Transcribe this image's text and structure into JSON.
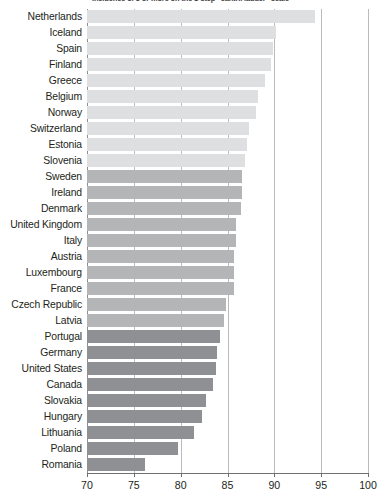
{
  "chart_data": {
    "type": "bar",
    "orientation": "horizontal",
    "title": "Incidence of 5 or more on the 1-step \"cantril ladder\" scale",
    "xlabel": "",
    "ylabel": "",
    "xlim": [
      70,
      100
    ],
    "xticks": [
      70,
      75,
      80,
      85,
      90,
      95,
      100
    ],
    "xtick_labels": [
      "70",
      "75",
      "80",
      "85",
      "90",
      "95",
      "100"
    ],
    "grid": true,
    "grid_axis": "x",
    "legend": false,
    "categories": [
      "Netherlands",
      "Iceland",
      "Spain",
      "Finland",
      "Greece",
      "Belgium",
      "Norway",
      "Switzerland",
      "Estonia",
      "Slovenia",
      "Sweden",
      "Ireland",
      "Denmark",
      "United Kingdom",
      "Italy",
      "Austria",
      "Luxembourg",
      "France",
      "Czech Republic",
      "Latvia",
      "Portugal",
      "Germany",
      "United States",
      "Canada",
      "Slovakia",
      "Hungary",
      "Lithuania",
      "Poland",
      "Romania"
    ],
    "values": [
      94.3,
      90.2,
      89.9,
      89.6,
      89.0,
      88.3,
      88.0,
      87.3,
      87.1,
      86.9,
      86.6,
      86.6,
      86.4,
      85.9,
      85.9,
      85.7,
      85.7,
      85.7,
      84.8,
      84.6,
      84.2,
      83.9,
      83.8,
      83.5,
      82.7,
      82.3,
      81.4,
      79.7,
      76.2
    ],
    "bar_colors": [
      "#dedfe0",
      "#dedfe0",
      "#dedfe0",
      "#dedfe0",
      "#dedfe0",
      "#dedfe0",
      "#dedfe0",
      "#dedfe0",
      "#dedfe0",
      "#dedfe0",
      "#b4b5b7",
      "#b4b5b7",
      "#b4b5b7",
      "#b4b5b7",
      "#b4b5b7",
      "#b4b5b7",
      "#b4b5b7",
      "#b4b5b7",
      "#b4b5b7",
      "#b4b5b7",
      "#8e9093",
      "#8e9093",
      "#8e9093",
      "#8e9093",
      "#8e9093",
      "#8e9093",
      "#8e9093",
      "#8e9093",
      "#8e9093"
    ]
  },
  "axis": {
    "grid_color": "#b9bcbe",
    "line_color": "#6e7174"
  }
}
